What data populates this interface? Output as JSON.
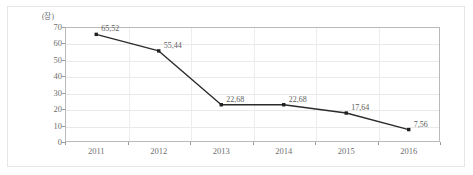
{
  "chart_data": {
    "type": "line",
    "title": "",
    "xlabel": "",
    "ylabel": "(장)",
    "categories": [
      "2011",
      "2012",
      "2013",
      "2014",
      "2015",
      "2016"
    ],
    "values": [
      65.52,
      55.44,
      22.68,
      22.68,
      17.64,
      7.56
    ],
    "point_labels": [
      "65,52",
      "55,44",
      "22,68",
      "22,68",
      "17,64",
      "7,56"
    ],
    "ylim": [
      0,
      70
    ],
    "ytick_values": [
      0,
      10,
      20,
      30,
      40,
      50,
      60,
      70
    ],
    "ytick_labels": [
      "0",
      "10",
      "20",
      "30",
      "40",
      "50",
      "60",
      "70"
    ],
    "grid": true,
    "legend": false,
    "series": [
      {
        "name": "series-1",
        "values": [
          65.52,
          55.44,
          22.68,
          22.68,
          17.64,
          7.56
        ],
        "line_color": "#2b2b2b",
        "marker_color": "#1f1f1f",
        "marker": "square"
      }
    ],
    "colors": {
      "line": "#2b2b2b",
      "marker": "#1f1f1f",
      "grid": "#e9e9e9",
      "axis": "#b9b9b9",
      "tick_text": "#6f6f6f",
      "label_text": "#5c5c5c",
      "outer_border": "#e6e6e6",
      "background": "#ffffff"
    }
  }
}
